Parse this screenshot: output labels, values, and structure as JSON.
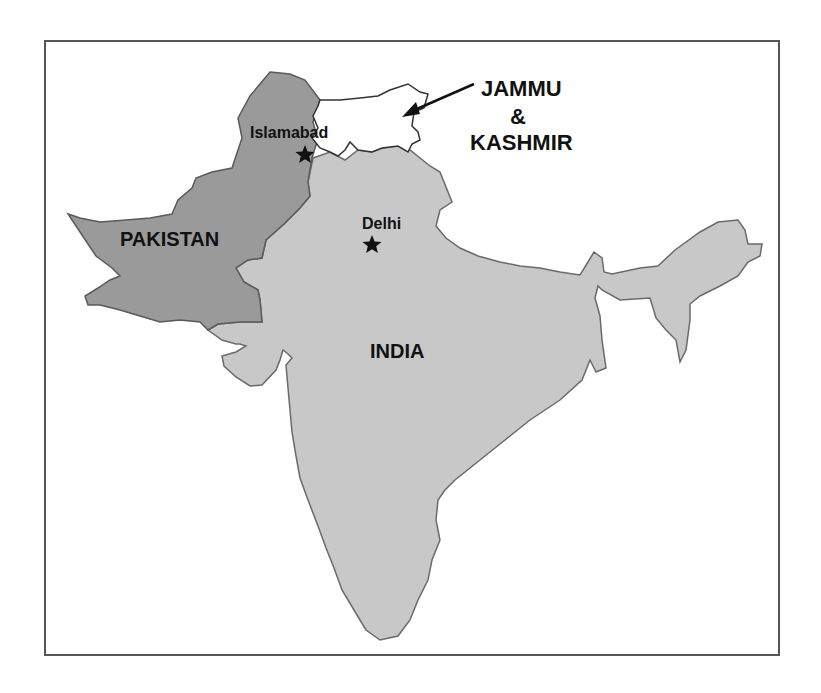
{
  "map": {
    "regions": [
      {
        "name": "PAKISTAN",
        "fill": "#9a9a9a"
      },
      {
        "name": "INDIA",
        "fill": "#c8c8c8"
      },
      {
        "name": "JAMMU & KASHMIR",
        "fill": "#ffffff"
      }
    ],
    "labels": {
      "pakistan": "PAKISTAN",
      "india": "INDIA",
      "jk_line1": "JAMMU",
      "jk_line2": "&",
      "jk_line3": "KASHMIR",
      "islamabad": "Islamabad",
      "delhi": "Delhi"
    },
    "capitals": [
      {
        "name": "Islamabad",
        "icon": "star-icon"
      },
      {
        "name": "Delhi",
        "icon": "star-icon"
      }
    ],
    "colors": {
      "pakistan_fill": "#9a9a9a",
      "india_fill": "#c8c8c8",
      "kashmir_fill": "#ffffff",
      "border": "#555555",
      "text": "#111111"
    }
  }
}
